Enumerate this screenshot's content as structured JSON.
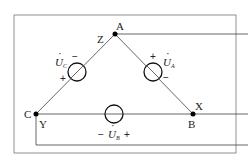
{
  "diagram": {
    "type": "three-phase delta-connected voltage sources",
    "nodes": {
      "A": {
        "label": "A",
        "terminal": "Z"
      },
      "B": {
        "label": "B",
        "terminal": "X"
      },
      "C": {
        "label": "C",
        "terminal": "Y"
      }
    },
    "sources": [
      {
        "id": "UA",
        "symbol": "U",
        "subscript": "A",
        "plus": "+",
        "minus": "−",
        "between": "A-B"
      },
      {
        "id": "UB",
        "symbol": "U",
        "subscript": "B",
        "plus": "+",
        "minus": "−",
        "between": "C-B"
      },
      {
        "id": "UC",
        "symbol": "U",
        "subscript": "C",
        "plus": "+",
        "minus": "−",
        "between": "C-A"
      }
    ],
    "colors": {
      "line": "#555555",
      "node": "#000000",
      "text": "#222222"
    }
  }
}
